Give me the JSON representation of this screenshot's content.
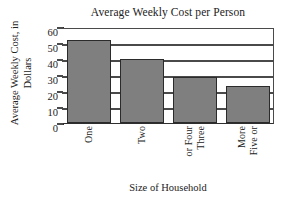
{
  "chart_data": {
    "type": "bar",
    "title": "Average Weekly Cost per Person",
    "xlabel": "Size of Household",
    "ylabel": "Average Weekly Cost, in Dollars",
    "ylabel_lines": [
      "Average Weekly Cost, in",
      "Dollars"
    ],
    "categories": [
      "One",
      "Two",
      "Three or Four",
      "Five or More"
    ],
    "category_lines": [
      [
        "One"
      ],
      [
        "Two"
      ],
      [
        "Three",
        "or Four"
      ],
      [
        "Five or",
        "More"
      ]
    ],
    "values": [
      52,
      40,
      29,
      23
    ],
    "ylim": [
      0,
      60
    ],
    "ytick_labels": [
      "0",
      "10",
      "20",
      "30",
      "40",
      "50",
      "60"
    ],
    "ytick_values": [
      0,
      10,
      20,
      30,
      40,
      50,
      60
    ],
    "grid": "horizontal",
    "legend": "none",
    "bar_color": "#7f7f7f",
    "bar_border_color": "#2b2b2b",
    "axis_color": "#2e2e2e",
    "grid_color": "#4a4a4a",
    "background_color": "#ffffff"
  }
}
